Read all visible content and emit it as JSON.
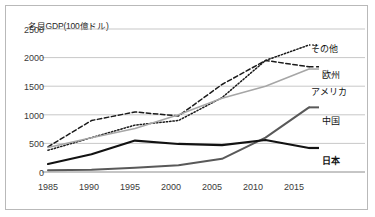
{
  "chart_data": {
    "type": "line",
    "title": "名目GDP(100億ドル)",
    "xlabel": "",
    "ylabel": "",
    "x": [
      1985,
      1990,
      1995,
      2000,
      2005,
      2010,
      2015
    ],
    "categories": [
      "1985",
      "1990",
      "1995",
      "2000",
      "2005",
      "2010",
      "2015"
    ],
    "ylim": [
      0,
      2500
    ],
    "yticks": [
      0,
      500,
      1000,
      1500,
      2000,
      2500
    ],
    "ytick_labels": [
      "0",
      "500",
      "1000",
      "1500",
      "2000",
      "2500"
    ],
    "grid": "horizontal",
    "legend_position": "right-inline-labels",
    "series": [
      {
        "name": "その他",
        "style": "dotted",
        "color": "#1a1a1a",
        "values": [
          380,
          600,
          820,
          900,
          1300,
          1950,
          2220
        ]
      },
      {
        "name": "欧州",
        "style": "dashed",
        "color": "#1a1a1a",
        "values": [
          440,
          900,
          1050,
          980,
          1530,
          1950,
          1840
        ]
      },
      {
        "name": "アメリカ",
        "style": "solid",
        "color": "#a6a6a6",
        "values": [
          430,
          600,
          760,
          1000,
          1290,
          1500,
          1800
        ]
      },
      {
        "name": "中国",
        "style": "solid",
        "color": "#595959",
        "values": [
          30,
          40,
          75,
          120,
          230,
          600,
          1130
        ]
      },
      {
        "name": "日本",
        "style": "solid",
        "color": "#121212",
        "values": [
          140,
          310,
          550,
          490,
          470,
          560,
          420
        ]
      }
    ]
  },
  "axis": {
    "y_ticks": [
      "2500",
      "2000",
      "1500",
      "1000",
      "500",
      "0"
    ],
    "x_ticks": [
      "1985",
      "1990",
      "1995",
      "2000",
      "2005",
      "2010",
      "2015"
    ]
  },
  "labels": {
    "other": "その他",
    "europe": "欧州",
    "america": "アメリカ",
    "china": "中国",
    "japan": "日本"
  }
}
